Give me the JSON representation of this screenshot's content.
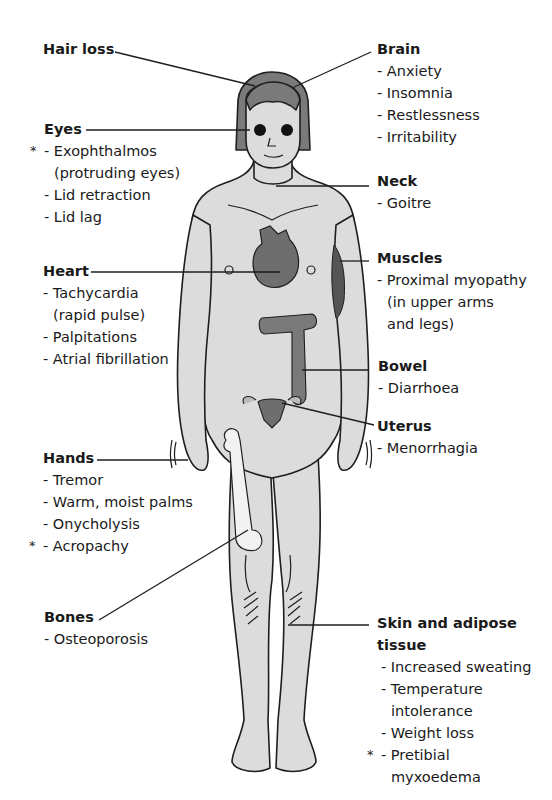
{
  "diagram": {
    "colors": {
      "skin": "#dcdcdc",
      "outline": "#1e1e1e",
      "organ": "#6e6e6e",
      "bone": "#f2f2f2",
      "text": "#1a1a1a"
    },
    "legend_marker": "*"
  },
  "labels": {
    "hair_loss": {
      "title": "Hair loss",
      "items": []
    },
    "eyes": {
      "title": "Eyes",
      "items": [
        {
          "text": "- Exophthalmos",
          "marked": true
        },
        {
          "text": "(protruding eyes)",
          "cont": true
        },
        {
          "text": "- Lid retraction"
        },
        {
          "text": "- Lid lag"
        }
      ]
    },
    "heart": {
      "title": "Heart",
      "items": [
        {
          "text": "- Tachycardia"
        },
        {
          "text": "(rapid pulse)",
          "cont": true
        },
        {
          "text": "- Palpitations"
        },
        {
          "text": "- Atrial fibrillation"
        }
      ]
    },
    "hands": {
      "title": "Hands",
      "items": [
        {
          "text": "- Tremor"
        },
        {
          "text": "- Warm, moist palms"
        },
        {
          "text": "- Onycholysis"
        },
        {
          "text": "- Acropachy",
          "marked": true
        }
      ]
    },
    "bones": {
      "title": "Bones",
      "items": [
        {
          "text": "- Osteoporosis"
        }
      ]
    },
    "brain": {
      "title": "Brain",
      "items": [
        {
          "text": "- Anxiety"
        },
        {
          "text": "- Insomnia"
        },
        {
          "text": "- Restlessness"
        },
        {
          "text": "- Irritability"
        }
      ]
    },
    "neck": {
      "title": "Neck",
      "items": [
        {
          "text": "- Goitre"
        }
      ]
    },
    "muscles": {
      "title": "Muscles",
      "items": [
        {
          "text": "- Proximal myopathy"
        },
        {
          "text": "(in upper arms",
          "cont": true
        },
        {
          "text": "and legs)",
          "cont": true
        }
      ]
    },
    "bowel": {
      "title": "Bowel",
      "items": [
        {
          "text": "- Diarrhoea"
        }
      ]
    },
    "uterus": {
      "title": "Uterus",
      "items": [
        {
          "text": "- Menorrhagia"
        }
      ]
    },
    "skin": {
      "title": "Skin and adipose",
      "title2": "tissue",
      "items": [
        {
          "text": "- Increased sweating"
        },
        {
          "text": "- Temperature"
        },
        {
          "text": "intolerance",
          "cont": true
        },
        {
          "text": "- Weight loss"
        },
        {
          "text": "- Pretibial",
          "marked": true
        },
        {
          "text": "myxoedema",
          "cont": true
        }
      ]
    }
  }
}
